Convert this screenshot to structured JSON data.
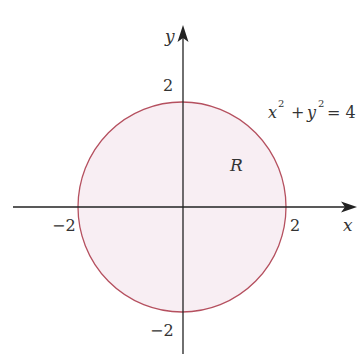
{
  "diagram": {
    "axes": {
      "x_label": "x",
      "y_label": "y",
      "ticks": {
        "x_neg": "−2",
        "x_pos": "2",
        "y_pos": "2",
        "y_neg": "−2"
      }
    },
    "region_label": "R",
    "equation": {
      "x": "x",
      "plus": "+",
      "y": "y",
      "exp": "2",
      "equals": "= 4"
    },
    "colors": {
      "circle_stroke": "#b5505f",
      "region_fill": "#f8eef3",
      "axis": "#222222",
      "text": "#333333"
    }
  }
}
